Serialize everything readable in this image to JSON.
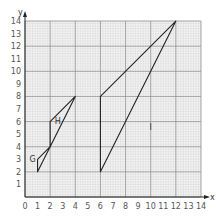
{
  "chart_data": {
    "type": "diagram",
    "title": "",
    "xlabel": "x",
    "ylabel": "y",
    "xlim": [
      0,
      14
    ],
    "ylim": [
      0,
      14
    ],
    "x_ticks": [
      "0",
      "1",
      "2",
      "3",
      "4",
      "5",
      "6",
      "7",
      "8",
      "9",
      "10",
      "11",
      "12",
      "13",
      "14"
    ],
    "y_ticks": [
      "1",
      "2",
      "3",
      "4",
      "5",
      "6",
      "7",
      "8",
      "9",
      "10",
      "11",
      "12",
      "13",
      "14"
    ],
    "grid": true,
    "shapes": [
      {
        "name": "G",
        "vertices": [
          [
            1,
            2
          ],
          [
            1,
            3
          ],
          [
            2,
            4
          ]
        ],
        "label_pos": [
          0.6,
          2.8
        ]
      },
      {
        "name": "H",
        "vertices": [
          [
            2,
            4
          ],
          [
            2,
            6
          ],
          [
            4,
            8
          ]
        ],
        "label_pos": [
          2.6,
          5.8
        ]
      },
      {
        "name": "I",
        "vertices": [
          [
            6,
            2
          ],
          [
            6,
            8
          ],
          [
            12,
            14
          ]
        ],
        "label_pos": [
          10,
          5.3
        ]
      }
    ]
  },
  "axis": {
    "x_label": "x",
    "y_label": "y"
  }
}
